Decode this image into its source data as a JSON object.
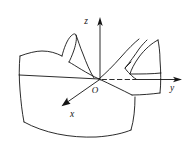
{
  "figure": {
    "name": "hyperbolic-paraboloid-saddle-surface",
    "background_color": "#ffffff",
    "stroke_color": "#141414",
    "width": 190,
    "height": 154
  },
  "axes": {
    "z": {
      "label": "z",
      "label_x": 86,
      "label_y": 24,
      "arrow": "up",
      "line": {
        "x1": 100,
        "y1": 80,
        "x2": 100,
        "y2": 20
      }
    },
    "y": {
      "label": "y",
      "label_x": 172,
      "label_y": 88,
      "arrow": "right",
      "line": {
        "x1": 100,
        "y1": 80,
        "x2": 181,
        "y2": 80
      },
      "dashed_segment": {
        "x1": 103,
        "y1": 79,
        "x2": 133,
        "y2": 79
      }
    },
    "x": {
      "label": "x",
      "label_x": 71,
      "label_y": 116,
      "arrow": "down-left",
      "line": {
        "x1": 100,
        "y1": 80,
        "x2": 62,
        "y2": 106
      }
    }
  },
  "origin": {
    "label": "O",
    "label_x": 95,
    "label_y": 92,
    "point_x": 100,
    "point_y": 80
  },
  "surface": {
    "type": "saddle",
    "description": "hyperbolic paraboloid rendered as a wireframe patch with two upward wings and a downward-curving front edge",
    "left_peak_present": true,
    "right_wing_present": true,
    "gridline_count": 2
  }
}
